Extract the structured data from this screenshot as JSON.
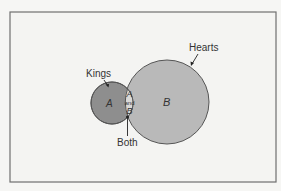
{
  "diagram": {
    "type": "venn",
    "sets": [
      {
        "id": "A",
        "label": "Kings",
        "region_label": "A",
        "color": "#8e8e8e"
      },
      {
        "id": "B",
        "label": "Hearts",
        "region_label": "B",
        "color": "#b9b9b9"
      }
    ],
    "intersection": {
      "label": "Both",
      "text_top": "A",
      "text_mid": "and",
      "text_bottom": "B",
      "color": "#d9d9d7"
    },
    "frame": {
      "border_color": "#6f6f6f",
      "background": "#f4f4f2"
    }
  }
}
